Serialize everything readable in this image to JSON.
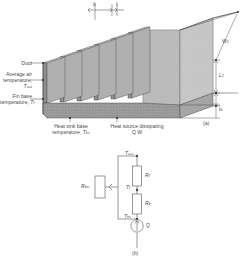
{
  "figure": {
    "panel_a_label": "(a)",
    "panel_b_label": "(b)",
    "callouts": {
      "duct": "Duct",
      "avg_air_line1": "Average air",
      "avg_air_line2": "temperature,",
      "avg_air_sym": "T",
      "avg_air_sub": "a-a",
      "fin_base_line1": "Fin base",
      "fin_base_line2": "temperature, ",
      "fin_base_sym": "T",
      "fin_base_sub": "f",
      "hs_base_line1": "Heat sink base",
      "hs_base_line2": "temperature, ",
      "hs_base_sym": "T",
      "hs_base_sub": "hs",
      "heat_source_line1": "Heat source dissipating",
      "heat_source_line2": "Q W"
    },
    "dimensions": {
      "gap": "b",
      "thickness": "t",
      "width": "W",
      "width_sub": "1",
      "length": "L",
      "length_sub": "1",
      "base_thk": "t",
      "base_thk_sub": "b"
    }
  },
  "network": {
    "node_top_sym": "T",
    "node_top_sub": "a-a",
    "node_mid_sym": "T",
    "node_mid_sub": "f",
    "node_bot_sym": "T",
    "node_bot_sub": "hs",
    "res_left_sym": "R",
    "res_left_sub": "ha",
    "res_upper_sym": "R",
    "res_upper_sub": "f",
    "res_lower_sym": "R",
    "res_lower_sub": "b",
    "source_sym": "Q"
  },
  "colors": {
    "fin_face": "#9a9a9a",
    "fin_top": "#c8c8c8",
    "fin_side": "#b5b5b5",
    "base_dark": "#8a8a8a",
    "stipple": "#a8a8a8",
    "line": "#444444",
    "text": "#4a4a4a"
  }
}
